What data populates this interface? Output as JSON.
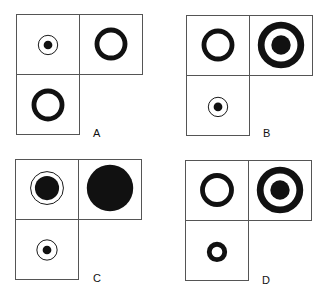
{
  "panels": [
    {
      "label": "A",
      "x": 16,
      "y": 14,
      "cells": [
        {
          "pos": "top-left",
          "symbol": "small-dot-in-thin-ring"
        },
        {
          "pos": "top-right",
          "symbol": "thick-ring"
        },
        {
          "pos": "bottom-left",
          "symbol": "thick-ring"
        }
      ]
    },
    {
      "label": "B",
      "x": 186,
      "y": 15,
      "cells": [
        {
          "pos": "top-left",
          "symbol": "thick-ring"
        },
        {
          "pos": "top-right",
          "symbol": "target-thick-ring-with-dot"
        },
        {
          "pos": "bottom-left",
          "symbol": "small-dot-in-thin-ring"
        }
      ]
    },
    {
      "label": "C",
      "x": 15,
      "y": 159,
      "cells": [
        {
          "pos": "top-left",
          "symbol": "large-dot-in-thin-ring"
        },
        {
          "pos": "top-right",
          "symbol": "large-filled-circle"
        },
        {
          "pos": "bottom-left",
          "symbol": "small-dot-in-thin-ring"
        }
      ]
    },
    {
      "label": "D",
      "x": 185,
      "y": 160,
      "cells": [
        {
          "pos": "top-left",
          "symbol": "thick-ring"
        },
        {
          "pos": "top-right",
          "symbol": "target-thick-ring-with-dot"
        },
        {
          "pos": "bottom-left",
          "symbol": "small-thick-ring"
        }
      ]
    }
  ]
}
